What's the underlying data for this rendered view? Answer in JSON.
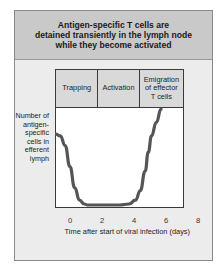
{
  "title": "Antigen-specific T cells are\ndetained transiently in the lymph node\nwhile they become activated",
  "phases": [
    {
      "label": "Trapping",
      "width": 43
    },
    {
      "label": "Activation",
      "width": 42
    },
    {
      "label": "Emigration\nof effector\nT cells",
      "width": 44
    }
  ],
  "y_axis_label": "Number of\nantigen-\nspecific\ncells in\nefferent\nlymph",
  "x_axis_label": "Time after start of viral infection (days)",
  "x_ticks": [
    "0",
    "2",
    "4",
    "6",
    "8"
  ],
  "colors": {
    "curve": "#555555",
    "header_bg": "#c9c9c9",
    "frame_bg": "#ececec",
    "plot_bg": "#ffffff"
  },
  "chart_data": {
    "type": "line",
    "title": "Antigen-specific T cells are detained transiently in the lymph node while they become activated",
    "xlabel": "Time after start of viral infection (days)",
    "ylabel": "Number of antigen-specific cells in efferent lymph",
    "xlim": [
      0,
      8
    ],
    "ylim": [
      0,
      1
    ],
    "x_ticks": [
      0,
      2,
      4,
      6,
      8
    ],
    "y_ticks": [],
    "grid": false,
    "phases": [
      {
        "name": "Trapping",
        "x_range": [
          0,
          2.7
        ]
      },
      {
        "name": "Activation",
        "x_range": [
          2.7,
          5.3
        ]
      },
      {
        "name": "Emigration of effector T cells",
        "x_range": [
          5.3,
          8
        ]
      }
    ],
    "series": [
      {
        "name": "Antigen-specific cells in efferent lymph",
        "x": [
          0,
          0.3,
          0.6,
          0.9,
          1.2,
          1.5,
          1.8,
          2.0,
          3.0,
          4.0,
          4.6,
          5.0,
          5.3,
          5.6,
          5.8,
          6.0,
          6.3,
          6.6
        ],
        "y": [
          0.74,
          0.72,
          0.62,
          0.4,
          0.18,
          0.05,
          0.01,
          0.0,
          0.0,
          0.0,
          0.01,
          0.05,
          0.15,
          0.35,
          0.55,
          0.72,
          0.86,
          1.0
        ]
      }
    ]
  }
}
